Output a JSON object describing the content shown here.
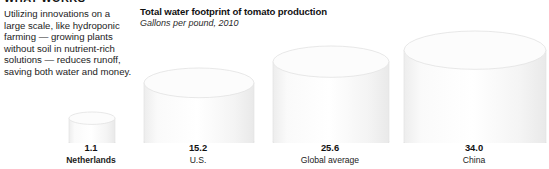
{
  "article": {
    "kicker": "WHAT WORKS",
    "body": "Utilizing innovations on a large scale, like hydroponic farming — growing plants without soil in nutrient-rich solutions — reduces runoff, saving both water and money."
  },
  "chart_data": {
    "type": "bar",
    "title": "Total water footprint of tomato production",
    "subtitle": "Gallons per pound, 2010",
    "xlabel": "",
    "ylabel": "Gallons per pound",
    "categories": [
      "Netherlands",
      "U.S.",
      "Global average",
      "China"
    ],
    "values": [
      1.1,
      15.2,
      25.6,
      34.0
    ],
    "value_labels": [
      "1.1",
      "15.2",
      "25.6",
      "34.0"
    ],
    "ylim": [
      0,
      34.0
    ],
    "grid": false,
    "legend": "none",
    "marker_style": "3d-cylinder",
    "highlight_category": "Netherlands",
    "colors": {
      "cylinder_body": "#f7f7f7",
      "cylinder_top": "#fcfcfc",
      "cylinder_edge": "#e2e2e2",
      "background": "#ffffff",
      "text": "#1a1a1a"
    }
  }
}
